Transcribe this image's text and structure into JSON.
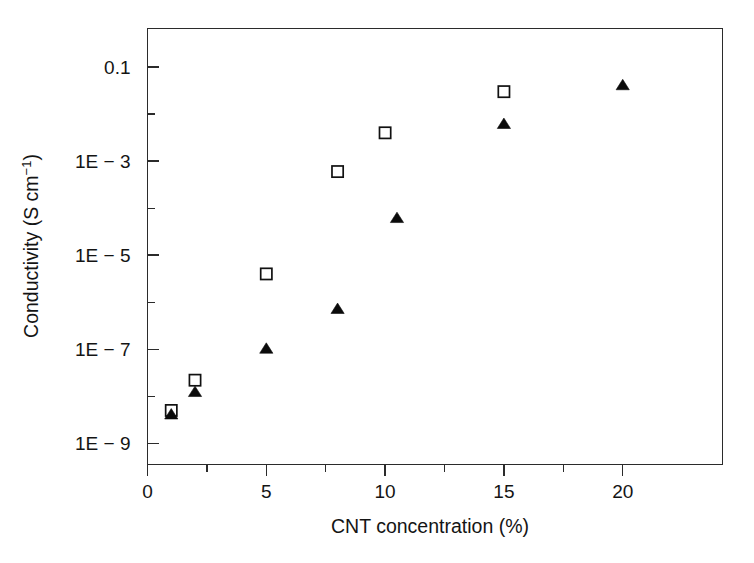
{
  "figure": {
    "background": "#ffffff",
    "frame_color": "#2b2b2b",
    "marker_color": "#111111"
  },
  "axes": {
    "x": {
      "title": "CNT concentration (%)",
      "tick_labels": [
        "0",
        "5",
        "10",
        "15",
        "20"
      ],
      "tick_values": [
        0,
        5,
        10,
        15,
        20
      ],
      "minor_tick_values": [
        2.5,
        7.5,
        12.5,
        17.5
      ],
      "range": [
        0,
        24.2
      ]
    },
    "y": {
      "title_main": "Conductivity (S cm",
      "title_sup": "−1",
      "title_close": ")",
      "title_full": "Conductivity (S cm⁻¹)",
      "tick_labels": [
        "0.1",
        "1E − 3",
        "1E − 5",
        "1E − 7",
        "1E − 9"
      ],
      "tick_values": [
        -1,
        -3,
        -5,
        -7,
        -9
      ],
      "minor_tick_values": [
        -2,
        -4,
        -6,
        -8
      ],
      "range_log10": [
        -9.45,
        -0.18
      ]
    }
  },
  "chart_data": {
    "type": "scatter",
    "title": "",
    "xlabel": "CNT concentration (%)",
    "ylabel": "Conductivity (S cm⁻¹)",
    "yscale": "log",
    "xlim": [
      0,
      24.2
    ],
    "ylim": [
      3.5e-10,
      0.66
    ],
    "grid": false,
    "legend": "none",
    "series": [
      {
        "name": "open-squares",
        "marker": "open-square",
        "color": "#111111",
        "points": [
          {
            "x": 1,
            "y": 5e-09
          },
          {
            "x": 2,
            "y": 2.2e-08
          },
          {
            "x": 5,
            "y": 4e-06
          },
          {
            "x": 8,
            "y": 0.0006
          },
          {
            "x": 10,
            "y": 0.004
          },
          {
            "x": 15,
            "y": 0.03
          }
        ]
      },
      {
        "name": "filled-triangles",
        "marker": "filled-triangle",
        "color": "#0b0b0b",
        "points": [
          {
            "x": 1,
            "y": 4e-09
          },
          {
            "x": 2,
            "y": 1.2e-08
          },
          {
            "x": 5,
            "y": 1e-07
          },
          {
            "x": 8,
            "y": 7e-07
          },
          {
            "x": 10.5,
            "y": 6e-05
          },
          {
            "x": 15,
            "y": 0.006
          },
          {
            "x": 20,
            "y": 0.04
          }
        ]
      }
    ]
  }
}
